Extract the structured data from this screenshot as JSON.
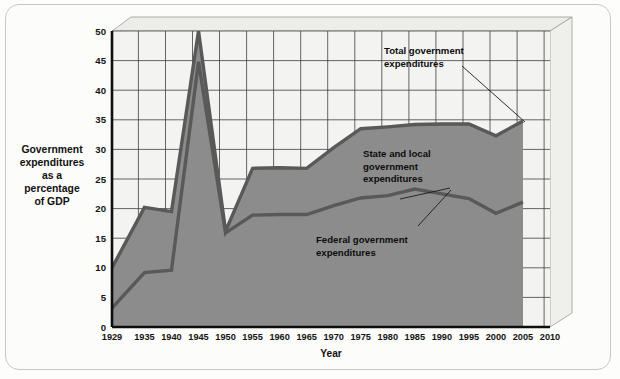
{
  "chart_data": {
    "type": "area",
    "title": "",
    "xlabel": "Year",
    "ylabel": "Government expenditures as a percentage of GDP",
    "ylabel_lines": [
      "Government",
      "expenditures",
      "as a",
      "percentage",
      "of GDP"
    ],
    "x": [
      1929,
      1935,
      1940,
      1945,
      1950,
      1955,
      1960,
      1965,
      1970,
      1975,
      1980,
      1985,
      1990,
      1995,
      2000,
      2005
    ],
    "xlim": [
      1929,
      2010
    ],
    "ylim": [
      0,
      50
    ],
    "ytick_values": [
      0,
      5,
      10,
      15,
      20,
      25,
      30,
      35,
      40,
      45,
      50
    ],
    "xtick_values": [
      1929,
      1935,
      1940,
      1945,
      1950,
      1955,
      1960,
      1965,
      1970,
      1975,
      1980,
      1985,
      1990,
      1995,
      2000,
      2005,
      2010
    ],
    "grid": true,
    "legend_position": "annotations-inline",
    "series": [
      {
        "name": "Total government expenditures",
        "values": [
          10.0,
          20.2,
          19.5,
          50.0,
          16.2,
          26.8,
          26.9,
          26.8,
          30.3,
          33.5,
          33.8,
          34.2,
          34.3,
          34.3,
          32.3,
          34.8
        ]
      },
      {
        "name": "Federal government expenditures",
        "values": [
          3.2,
          9.2,
          9.6,
          44.8,
          15.9,
          18.9,
          19.0,
          19.0,
          20.5,
          21.8,
          22.2,
          23.3,
          22.5,
          21.7,
          19.2,
          21.1
        ]
      }
    ],
    "annotations": [
      {
        "id": "total-government",
        "lines": [
          "Total government",
          "expenditures"
        ],
        "text_x": 384,
        "text_y": 54,
        "leader": {
          "x1": 462,
          "y1": 66,
          "x2": 525,
          "y2": 122
        }
      },
      {
        "id": "state-and-local",
        "lines": [
          "State and local",
          "government",
          "expenditures"
        ],
        "text_x": 363,
        "text_y": 157,
        "leader": {
          "x1": 400,
          "y1": 199,
          "x2": 450,
          "y2": 188
        }
      },
      {
        "id": "federal-government",
        "lines": [
          "Federal government",
          "expenditures"
        ],
        "text_x": 316,
        "text_y": 243,
        "leader": {
          "x1": 418,
          "y1": 226,
          "x2": 451,
          "y2": 190
        }
      }
    ],
    "colors": {
      "total_band_fill": "#8c8c8c",
      "federal_band_fill": "#8c8c8c",
      "line": "#545454",
      "plot_background": "#f2f2f0",
      "gridline": "#3d3d3d",
      "axis": "#121212",
      "depth_face": "#e8e8e4",
      "frame": "#c9c9c4"
    }
  }
}
